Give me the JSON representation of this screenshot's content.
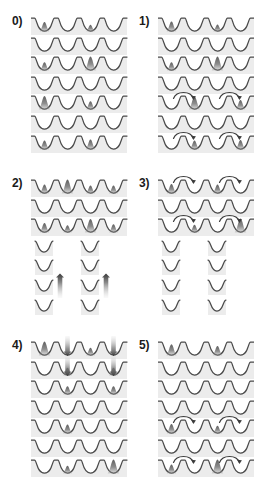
{
  "figure": {
    "width": 254,
    "height": 486,
    "background_color": "#ffffff",
    "lattice_line_color": "#4a4a4a",
    "lattice_fill_color": "#ececec",
    "peak_color_dark": "#555555",
    "peak_color_mid": "#8a8a8a",
    "arrow_color": "#3c3c3c",
    "panel_columns": 2,
    "panel_rows": 3,
    "rows_per_panel": 7,
    "wells_per_row": 4
  },
  "panels": [
    {
      "id": "panel-0",
      "label": "0)",
      "label_text": "0",
      "column": 0,
      "row": 0,
      "rows": [
        {
          "kind": "lattice",
          "wells": 4,
          "peaks": [
            {
              "well": 0,
              "height": 0.55,
              "shade": "dark"
            },
            {
              "well": 2,
              "height": 0.3,
              "shade": "dark"
            }
          ],
          "arrows": []
        },
        {
          "kind": "lattice",
          "wells": 4,
          "peaks": [],
          "arrows": []
        },
        {
          "kind": "lattice",
          "wells": 4,
          "peaks": [
            {
              "well": 0,
              "height": 0.45,
              "shade": "dark"
            },
            {
              "well": 2,
              "height": 0.95,
              "shade": "dark"
            }
          ],
          "arrows": []
        },
        {
          "kind": "lattice",
          "wells": 4,
          "peaks": [],
          "arrows": []
        },
        {
          "kind": "lattice",
          "wells": 4,
          "peaks": [
            {
              "well": 0,
              "height": 0.9,
              "shade": "dark"
            },
            {
              "well": 2,
              "height": 0.45,
              "shade": "dark"
            }
          ],
          "arrows": []
        },
        {
          "kind": "lattice",
          "wells": 4,
          "peaks": [],
          "arrows": []
        },
        {
          "kind": "lattice",
          "wells": 4,
          "peaks": [
            {
              "well": 0,
              "height": 0.5,
              "shade": "dark"
            },
            {
              "well": 2,
              "height": 0.6,
              "shade": "dark"
            }
          ],
          "arrows": []
        }
      ]
    },
    {
      "id": "panel-1",
      "label": "1)",
      "label_text": "1",
      "column": 1,
      "row": 0,
      "rows": [
        {
          "kind": "lattice",
          "wells": 4,
          "peaks": [
            {
              "well": 0,
              "height": 0.6,
              "shade": "dark"
            },
            {
              "well": 2,
              "height": 0.32,
              "shade": "dark"
            }
          ],
          "arrows": []
        },
        {
          "kind": "lattice",
          "wells": 4,
          "peaks": [],
          "arrows": []
        },
        {
          "kind": "lattice",
          "wells": 4,
          "peaks": [
            {
              "well": 0,
              "height": 0.45,
              "shade": "dark"
            },
            {
              "well": 2,
              "height": 0.95,
              "shade": "dark"
            }
          ],
          "arrows": []
        },
        {
          "kind": "lattice",
          "wells": 4,
          "peaks": [],
          "arrows": []
        },
        {
          "kind": "lattice",
          "wells": 4,
          "peaks": [
            {
              "well": 1,
              "height": 0.85,
              "shade": "dark"
            },
            {
              "well": 3,
              "height": 0.55,
              "shade": "dark"
            }
          ],
          "arrows": [
            {
              "from_well": 0,
              "to_well": 1,
              "direction": "right"
            },
            {
              "from_well": 2,
              "to_well": 3,
              "direction": "right"
            }
          ]
        },
        {
          "kind": "lattice",
          "wells": 4,
          "peaks": [],
          "arrows": []
        },
        {
          "kind": "lattice",
          "wells": 4,
          "peaks": [
            {
              "well": 1,
              "height": 0.5,
              "shade": "dark"
            },
            {
              "well": 3,
              "height": 0.55,
              "shade": "dark"
            }
          ],
          "arrows": [
            {
              "from_well": 0,
              "to_well": 1,
              "direction": "right"
            },
            {
              "from_well": 2,
              "to_well": 3,
              "direction": "right"
            }
          ]
        }
      ]
    },
    {
      "id": "panel-2",
      "label": "2)",
      "label_text": "2",
      "column": 0,
      "row": 1,
      "rows": [
        {
          "kind": "lattice",
          "wells": 4,
          "peaks": [
            {
              "well": 0,
              "height": 0.5,
              "shade": "dark"
            },
            {
              "well": 1,
              "height": 0.95,
              "shade": "dark"
            },
            {
              "well": 2,
              "height": 0.42,
              "shade": "dark"
            },
            {
              "well": 3,
              "height": 0.42,
              "shade": "dark"
            }
          ],
          "arrows": []
        },
        {
          "kind": "lattice",
          "wells": 4,
          "peaks": [],
          "arrows": []
        },
        {
          "kind": "lattice",
          "wells": 4,
          "peaks": [
            {
              "well": 0,
              "height": 0.55,
              "shade": "dark"
            },
            {
              "well": 1,
              "height": 0.35,
              "shade": "dark"
            },
            {
              "well": 2,
              "height": 0.9,
              "shade": "dark"
            },
            {
              "well": 3,
              "height": 0.45,
              "shade": "dark"
            }
          ],
          "arrows": []
        },
        {
          "kind": "split",
          "wells": 2,
          "peaks": [],
          "beams": []
        },
        {
          "kind": "split",
          "wells": 2,
          "peaks": [],
          "beams": []
        },
        {
          "kind": "split",
          "wells": 2,
          "peaks": [],
          "beams": [
            {
              "slot": 0,
              "direction": "up"
            },
            {
              "slot": 1,
              "direction": "up"
            }
          ]
        },
        {
          "kind": "split",
          "wells": 2,
          "peaks": [],
          "beams": []
        }
      ]
    },
    {
      "id": "panel-3",
      "label": "3)",
      "label_text": "3",
      "column": 1,
      "row": 1,
      "rows": [
        {
          "kind": "lattice",
          "wells": 4,
          "peaks": [
            {
              "well": 0,
              "height": 0.55,
              "shade": "dark"
            },
            {
              "well": 2,
              "height": 0.5,
              "shade": "dark"
            }
          ],
          "arrows": [
            {
              "from_well": 0,
              "to_well": 1,
              "direction": "right"
            },
            {
              "from_well": 2,
              "to_well": 3,
              "direction": "right"
            }
          ]
        },
        {
          "kind": "lattice",
          "wells": 4,
          "peaks": [],
          "arrows": []
        },
        {
          "kind": "lattice",
          "wells": 4,
          "peaks": [
            {
              "well": 1,
              "height": 0.4,
              "shade": "dark"
            },
            {
              "well": 3,
              "height": 0.95,
              "shade": "dark"
            }
          ],
          "arrows": [
            {
              "from_well": 0,
              "to_well": 1,
              "direction": "right"
            },
            {
              "from_well": 2,
              "to_well": 3,
              "direction": "right"
            }
          ]
        },
        {
          "kind": "split",
          "wells": 2,
          "peaks": [],
          "beams": []
        },
        {
          "kind": "split",
          "wells": 2,
          "peaks": [],
          "beams": []
        },
        {
          "kind": "split",
          "wells": 2,
          "peaks": [],
          "beams": []
        },
        {
          "kind": "split",
          "wells": 2,
          "peaks": [],
          "beams": []
        }
      ]
    },
    {
      "id": "panel-4",
      "label": "4)",
      "label_text": "4",
      "column": 0,
      "row": 2,
      "rows": [
        {
          "kind": "lattice",
          "wells": 4,
          "peaks": [
            {
              "well": 0,
              "height": 0.95,
              "shade": "dark"
            },
            {
              "well": 2,
              "height": 0.4,
              "shade": "dark"
            }
          ],
          "beams": [
            {
              "well": 1,
              "direction": "down"
            },
            {
              "well": 3,
              "direction": "down"
            }
          ],
          "arrows": []
        },
        {
          "kind": "lattice",
          "wells": 4,
          "peaks": [
            {
              "well": 1,
              "height": 0.4,
              "shade": "dark"
            },
            {
              "well": 3,
              "height": 0.4,
              "shade": "dark"
            }
          ],
          "beams": [
            {
              "well": 1,
              "direction": "down"
            },
            {
              "well": 3,
              "direction": "down"
            }
          ],
          "arrows": []
        },
        {
          "kind": "lattice",
          "wells": 4,
          "peaks": [
            {
              "well": 1,
              "height": 0.45,
              "shade": "dark"
            },
            {
              "well": 3,
              "height": 0.45,
              "shade": "dark"
            }
          ],
          "arrows": []
        },
        {
          "kind": "lattice",
          "wells": 4,
          "peaks": [],
          "arrows": []
        },
        {
          "kind": "lattice",
          "wells": 4,
          "peaks": [
            {
              "well": 1,
              "height": 0.5,
              "shade": "dark"
            }
          ],
          "arrows": []
        },
        {
          "kind": "lattice",
          "wells": 4,
          "peaks": [],
          "arrows": []
        },
        {
          "kind": "lattice",
          "wells": 4,
          "peaks": [
            {
              "well": 1,
              "height": 0.4,
              "shade": "dark"
            },
            {
              "well": 3,
              "height": 0.95,
              "shade": "dark"
            }
          ],
          "arrows": []
        }
      ]
    },
    {
      "id": "panel-5",
      "label": "5)",
      "label_text": "5",
      "column": 1,
      "row": 2,
      "rows": [
        {
          "kind": "lattice",
          "wells": 4,
          "peaks": [
            {
              "well": 0,
              "height": 0.7,
              "shade": "dark"
            },
            {
              "well": 2,
              "height": 0.55,
              "shade": "dark"
            }
          ],
          "arrows": []
        },
        {
          "kind": "lattice",
          "wells": 4,
          "peaks": [],
          "arrows": []
        },
        {
          "kind": "lattice",
          "wells": 4,
          "peaks": [],
          "arrows": []
        },
        {
          "kind": "lattice",
          "wells": 4,
          "peaks": [],
          "arrows": []
        },
        {
          "kind": "lattice",
          "wells": 4,
          "peaks": [
            {
              "well": 0,
              "height": 0.55,
              "shade": "dark"
            },
            {
              "well": 2,
              "height": 0.4,
              "shade": "dark"
            }
          ],
          "arrows": [
            {
              "from_well": 0,
              "to_well": 1,
              "direction": "right"
            },
            {
              "from_well": 2,
              "to_well": 3,
              "direction": "right"
            }
          ]
        },
        {
          "kind": "lattice",
          "wells": 4,
          "peaks": [],
          "arrows": []
        },
        {
          "kind": "lattice",
          "wells": 4,
          "peaks": [
            {
              "well": 0,
              "height": 0.5,
              "shade": "dark"
            },
            {
              "well": 2,
              "height": 0.95,
              "shade": "dark"
            }
          ],
          "arrows": [
            {
              "from_well": 0,
              "to_well": 1,
              "direction": "right"
            },
            {
              "from_well": 2,
              "to_well": 3,
              "direction": "right"
            }
          ]
        }
      ]
    }
  ]
}
